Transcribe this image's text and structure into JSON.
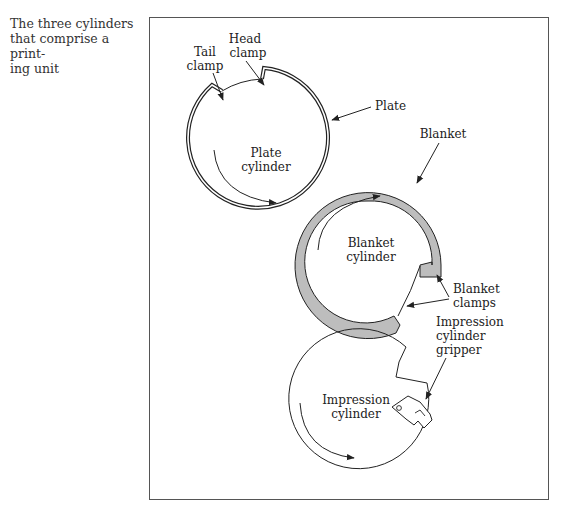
{
  "caption": {
    "line1": "The three cylinders",
    "line2": "that comprise a print-",
    "line3": "ing unit"
  },
  "labels": {
    "tail_clamp": [
      "Tail",
      "clamp"
    ],
    "head_clamp": [
      "Head",
      "clamp"
    ],
    "plate": "Plate",
    "plate_cylinder": [
      "Plate",
      "cylinder"
    ],
    "blanket": "Blanket",
    "blanket_cylinder": [
      "Blanket",
      "cylinder"
    ],
    "blanket_clamps": [
      "Blanket",
      "clamps"
    ],
    "impression_cylinder_gripper": [
      "Impression",
      "cylinder",
      "gripper"
    ],
    "impression_cylinder": [
      "Impression",
      "cylinder"
    ]
  },
  "colors": {
    "blanket_fill": "#bdbdbd",
    "line": "#222222",
    "frame": "#555555"
  }
}
